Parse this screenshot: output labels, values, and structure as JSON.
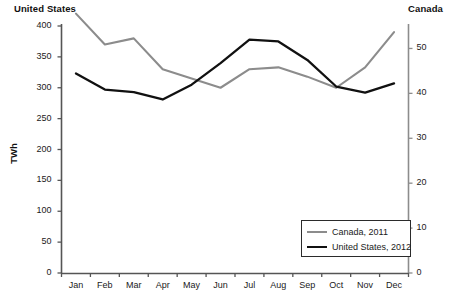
{
  "chart_data": {
    "type": "line",
    "title": "",
    "xlabel": "",
    "ylabel": "TWh",
    "left_axis": {
      "name": "United States",
      "label": "TWh",
      "ylim": [
        0,
        400
      ],
      "ticks": [
        0,
        50,
        100,
        150,
        200,
        250,
        300,
        350,
        400
      ],
      "tick_labels": [
        "0",
        "50",
        "100",
        "150",
        "200",
        "250",
        "300",
        "350",
        "400"
      ]
    },
    "right_axis": {
      "name": "Canada",
      "ylim": [
        0,
        55
      ],
      "ticks": [
        0,
        10,
        20,
        30,
        40,
        50
      ],
      "tick_labels": [
        "0",
        "10",
        "20",
        "30",
        "40",
        "50"
      ]
    },
    "categories": [
      "Jan",
      "Feb",
      "Mar",
      "Apr",
      "May",
      "Jun",
      "Jul",
      "Aug",
      "Sep",
      "Oct",
      "Nov",
      "Dec"
    ],
    "grid": false,
    "legend_position": "bottom-right",
    "series": [
      {
        "name": "Canada, 2011",
        "axis": "right",
        "color": "#8c8c8c",
        "unit": "TWh",
        "values_left_scale": [
          420,
          370,
          380,
          330,
          315,
          300,
          330,
          333,
          318,
          300,
          333,
          390
        ],
        "values": [
          57.8,
          50.9,
          52.3,
          45.4,
          43.3,
          41.3,
          45.4,
          45.8,
          43.7,
          41.3,
          45.8,
          53.6
        ]
      },
      {
        "name": "United States, 2012",
        "axis": "left",
        "color": "#111111",
        "unit": "TWh",
        "values": [
          323,
          297,
          293,
          281,
          305,
          340,
          378,
          375,
          345,
          302,
          292,
          307
        ]
      }
    ]
  },
  "legend": {
    "items": [
      {
        "label": "Canada, 2011",
        "color": "#8c8c8c"
      },
      {
        "label": "United States, 2012",
        "color": "#111111"
      }
    ]
  }
}
